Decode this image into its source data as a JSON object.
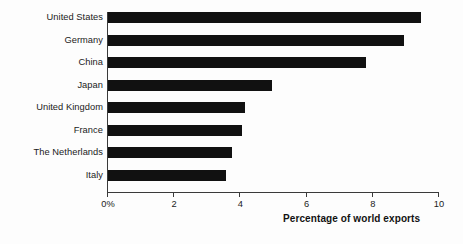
{
  "chart_data": {
    "type": "bar",
    "orientation": "horizontal",
    "title": "",
    "subtitle": "",
    "xlabel": "Percentage of world exports",
    "ylabel": "",
    "xlim": [
      0,
      10
    ],
    "grid": false,
    "legend": false,
    "bar_color": "#111111",
    "axis_color": "#3a3a3a",
    "background_color": "#fdfdfd",
    "categories": [
      "United States",
      "Germany",
      "China",
      "Japan",
      "United Kingdom",
      "France",
      "The Netherlands",
      "Italy"
    ],
    "values": [
      9.45,
      8.95,
      7.8,
      4.95,
      4.15,
      4.05,
      3.75,
      3.55
    ],
    "xticks": [
      0,
      2,
      4,
      6,
      8,
      10
    ],
    "xtick_labels": [
      "0%",
      "2",
      "4",
      "6",
      "8",
      "10"
    ]
  }
}
